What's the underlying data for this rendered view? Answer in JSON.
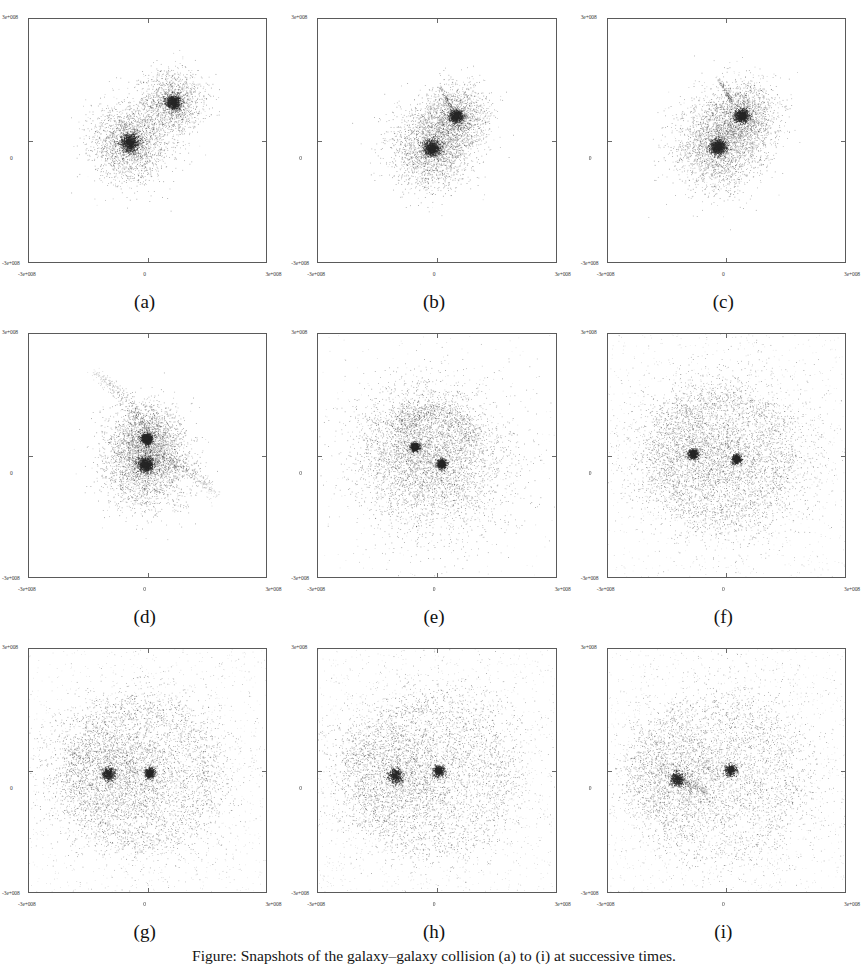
{
  "figure": {
    "caption": "Figure: Snapshots of the galaxy–galaxy collision (a) to (i) at successive times.",
    "axis_tick_labels": {
      "x_left": "-3e+008",
      "x_mid": "0",
      "x_right": "3e+008",
      "y_top": "3e+008",
      "y_mid": "0",
      "y_bottom": "-3e+008"
    },
    "point_color": "#262626",
    "frame_color": "#5a5a5a",
    "background_color": "#ffffff"
  },
  "panels": [
    {
      "id": "a",
      "label": "(a)",
      "stage": "approach",
      "seed": 11
    },
    {
      "id": "b",
      "label": "(b)",
      "stage": "first-contact",
      "seed": 22
    },
    {
      "id": "c",
      "label": "(c)",
      "stage": "overlap",
      "seed": 33
    },
    {
      "id": "d",
      "label": "(d)",
      "stage": "tidal-tails",
      "seed": 44
    },
    {
      "id": "e",
      "label": "(e)",
      "stage": "halo-expansion",
      "seed": 55
    },
    {
      "id": "f",
      "label": "(f)",
      "stage": "shell-forming",
      "seed": 66
    },
    {
      "id": "g",
      "label": "(g)",
      "stage": "wide-shell",
      "seed": 77
    },
    {
      "id": "h",
      "label": "(h)",
      "stage": "dispersing",
      "seed": 88
    },
    {
      "id": "i",
      "label": "(i)",
      "stage": "separated-cores",
      "seed": 99
    }
  ],
  "chart_data": {
    "type": "scatter",
    "title": "",
    "xlabel": "",
    "ylabel": "",
    "xlim": [
      -300000000.0,
      300000000.0
    ],
    "ylim": [
      -300000000.0,
      300000000.0
    ],
    "xticks": [
      -300000000.0,
      0,
      300000000.0
    ],
    "yticks": [
      -300000000.0,
      0,
      300000000.0
    ],
    "xticklabels": [
      "-3e+008",
      "0",
      "3e+008"
    ],
    "yticklabels": [
      "-3e+008",
      "0",
      "3e+008"
    ],
    "grid": false,
    "legend": null,
    "marker": "point",
    "marker_color": "#262626",
    "subplots": [
      {
        "panel": "a",
        "description": "Two compact, well separated spherical galaxies before contact.",
        "n_points": 5200,
        "components": [
          {
            "name": "primary-galaxy",
            "center": [
              -45000000.0,
              -5000000.0
            ],
            "core_sigma": 11000000.0,
            "halo_sigma": 50000000.0,
            "n_core": 900,
            "n_halo": 2100,
            "density": "dense-core"
          },
          {
            "name": "secondary-galaxy",
            "center": [
              65000000.0,
              95000000.0
            ],
            "core_sigma": 9000000.0,
            "halo_sigma": 40000000.0,
            "n_core": 800,
            "n_halo": 1400,
            "density": "dense-core"
          }
        ],
        "tails": []
      },
      {
        "panel": "b",
        "description": "Galaxies touching; envelopes begin to overlap, small plume at upper left of secondary.",
        "n_points": 5400,
        "components": [
          {
            "name": "primary-galaxy",
            "center": [
              -12000000.0,
              -18000000.0
            ],
            "core_sigma": 10000000.0,
            "halo_sigma": 52000000.0,
            "n_core": 900,
            "n_halo": 2100,
            "density": "dense-core"
          },
          {
            "name": "secondary-galaxy",
            "center": [
              50000000.0,
              60000000.0
            ],
            "core_sigma": 8500000.0,
            "halo_sigma": 42000000.0,
            "n_core": 800,
            "n_halo": 1500,
            "density": "dense-core"
          }
        ],
        "tails": [
          {
            "name": "plume",
            "from": [
              35000000.0,
              85000000.0
            ],
            "to": [
              5000000.0,
              135000000.0
            ],
            "n_points": 90,
            "width": 5000000.0
          }
        ]
      },
      {
        "panel": "c",
        "description": "Envelopes strongly overlapping, forming a common distorted body; faint spur upward.",
        "n_points": 5600,
        "components": [
          {
            "name": "primary-galaxy",
            "center": [
              -22000000.0,
              -15000000.0
            ],
            "core_sigma": 10000000.0,
            "halo_sigma": 55000000.0,
            "n_core": 900,
            "n_halo": 2200,
            "density": "dense-core"
          },
          {
            "name": "secondary-galaxy",
            "center": [
              38000000.0,
              62000000.0
            ],
            "core_sigma": 8500000.0,
            "halo_sigma": 48000000.0,
            "n_core": 820,
            "n_halo": 1600,
            "density": "dense-core"
          }
        ],
        "tails": [
          {
            "name": "spur",
            "from": [
              12000000.0,
              95000000.0
            ],
            "to": [
              -25000000.0,
              155000000.0
            ],
            "n_points": 120,
            "width": 5000000.0
          }
        ]
      },
      {
        "panel": "d",
        "description": "Merger with prominent curved tidal tails extending to upper-left and lower-right.",
        "n_points": 6000,
        "components": [
          {
            "name": "primary-core",
            "center": [
              -5000000.0,
              -22000000.0
            ],
            "core_sigma": 9000000.0,
            "halo_sigma": 58000000.0,
            "n_core": 950,
            "n_halo": 2200,
            "density": "very-dense-core"
          },
          {
            "name": "secondary-core",
            "center": [
              -2000000.0,
              42000000.0
            ],
            "core_sigma": 7000000.0,
            "halo_sigma": 45000000.0,
            "n_core": 850,
            "n_halo": 1500,
            "density": "very-dense-core"
          }
        ],
        "tails": [
          {
            "name": "upper-left-tail",
            "from": [
              -5000000.0,
              75000000.0
            ],
            "to": [
              -135000000.0,
              205000000.0
            ],
            "n_points": 260,
            "width": 13000000.0
          },
          {
            "name": "lower-right-tail",
            "from": [
              45000000.0,
              -5000000.0
            ],
            "to": [
              175000000.0,
              -100000000.0
            ],
            "n_points": 220,
            "width": 14000000.0
          }
        ]
      },
      {
        "panel": "e",
        "description": "Two very dense compact cores inside a broad diffuse halo with an arc above.",
        "n_points": 7200,
        "components": [
          {
            "name": "primary-core",
            "center": [
              12000000.0,
              -20000000.0
            ],
            "core_sigma": 5500000.0,
            "halo_sigma": 95000000.0,
            "n_core": 700,
            "n_halo": 2600,
            "density": "very-dense-core"
          },
          {
            "name": "secondary-core",
            "center": [
              -55000000.0,
              22000000.0
            ],
            "core_sigma": 5500000.0,
            "halo_sigma": 80000000.0,
            "n_core": 650,
            "n_halo": 2000,
            "density": "very-dense-core"
          }
        ],
        "tails": [
          {
            "name": "upper-arc",
            "center": [
              -10000000.0,
              10000000.0
            ],
            "radius": 105000000.0,
            "angle_from": 15,
            "angle_to": 150,
            "n_points": 500,
            "width": 16000000.0
          }
        ]
      },
      {
        "panel": "f",
        "description": "Cores further apart; large diffuse shell/ring of ejected particles surrounds the pair.",
        "n_points": 8000,
        "components": [
          {
            "name": "primary-core",
            "center": [
              25000000.0,
              -8000000.0
            ],
            "core_sigma": 5500000.0,
            "halo_sigma": 105000000.0,
            "n_core": 550,
            "n_halo": 2500,
            "density": "very-dense-core"
          },
          {
            "name": "secondary-core",
            "center": [
              -85000000.0,
              5000000.0
            ],
            "core_sigma": 6000000.0,
            "halo_sigma": 85000000.0,
            "n_core": 550,
            "n_halo": 2000,
            "density": "very-dense-core"
          }
        ],
        "tails": [
          {
            "name": "outer-shell",
            "center": [
              -10000000.0,
              -5000000.0
            ],
            "radius": 155000000.0,
            "angle_from": -200,
            "angle_to": 160,
            "n_points": 900,
            "width": 22000000.0
          }
        ]
      },
      {
        "panel": "g",
        "description": "Wide shell fully developed; two cores near centre-left and centre.",
        "n_points": 8400,
        "components": [
          {
            "name": "primary-core",
            "center": [
              5000000.0,
              -5000000.0
            ],
            "core_sigma": 6000000.0,
            "halo_sigma": 110000000.0,
            "n_core": 520,
            "n_halo": 2400,
            "density": "very-dense-core"
          },
          {
            "name": "secondary-core",
            "center": [
              -100000000.0,
              -8000000.0
            ],
            "core_sigma": 8000000.0,
            "halo_sigma": 80000000.0,
            "n_core": 520,
            "n_halo": 1900,
            "density": "very-dense-core"
          }
        ],
        "tails": [
          {
            "name": "outer-shell",
            "center": [
              -15000000.0,
              -10000000.0
            ],
            "radius": 170000000.0,
            "angle_from": -205,
            "angle_to": 165,
            "n_points": 1100,
            "width": 24000000.0
          }
        ]
      },
      {
        "panel": "h",
        "description": "Particles dispersing; shell thinner, cores remain compact.",
        "n_points": 8200,
        "components": [
          {
            "name": "primary-core",
            "center": [
              5000000.0,
              0.0
            ],
            "core_sigma": 7000000.0,
            "halo_sigma": 115000000.0,
            "n_core": 450,
            "n_halo": 2300,
            "density": "dense-core"
          },
          {
            "name": "secondary-core",
            "center": [
              -105000000.0,
              -12000000.0
            ],
            "core_sigma": 9000000.0,
            "halo_sigma": 80000000.0,
            "n_core": 480,
            "n_halo": 1800,
            "density": "dense-core"
          }
        ],
        "tails": [
          {
            "name": "outer-shell",
            "center": [
              -20000000.0,
              -15000000.0
            ],
            "radius": 180000000.0,
            "angle_from": -210,
            "angle_to": 170,
            "n_points": 950,
            "width": 26000000.0
          }
        ]
      },
      {
        "panel": "i",
        "description": "Two separated cores; secondary at left with small trailing stream, diffuse background.",
        "n_points": 8000,
        "components": [
          {
            "name": "primary-core",
            "center": [
              10000000.0,
              2000000.0
            ],
            "core_sigma": 7500000.0,
            "halo_sigma": 115000000.0,
            "n_core": 430,
            "n_halo": 2300,
            "density": "dense-core"
          },
          {
            "name": "secondary-core",
            "center": [
              -125000000.0,
              -20000000.0
            ],
            "core_sigma": 8500000.0,
            "halo_sigma": 72000000.0,
            "n_core": 450,
            "n_halo": 1600,
            "density": "dense-core"
          }
        ],
        "tails": [
          {
            "name": "outer-shell",
            "center": [
              -25000000.0,
              -20000000.0
            ],
            "radius": 185000000.0,
            "angle_from": -215,
            "angle_to": 175,
            "n_points": 800,
            "width": 28000000.0
          },
          {
            "name": "trailing-stream",
            "from": [
              -115000000.0,
              -30000000.0
            ],
            "to": [
              -45000000.0,
              -60000000.0
            ],
            "n_points": 150,
            "width": 10000000.0
          }
        ]
      }
    ]
  }
}
